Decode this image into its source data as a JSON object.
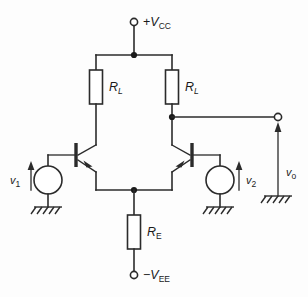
{
  "figure": {
    "background_color": "#fdfdfd",
    "line_color": "#2b2b2b"
  },
  "terminals": {
    "supply_positive": {
      "sign": "+",
      "symbol": "V",
      "subscript": "CC",
      "text": "+VCC"
    },
    "supply_negative": {
      "sign": "−",
      "symbol": "V",
      "subscript": "EE",
      "text": "−VEE"
    },
    "output": {
      "symbol": "v",
      "subscript": "o",
      "text": "vo"
    }
  },
  "components": {
    "load_resistor_left": {
      "symbol": "R",
      "subscript": "L",
      "text": "RL"
    },
    "load_resistor_right": {
      "symbol": "R",
      "subscript": "L",
      "text": "RL"
    },
    "emitter_resistor": {
      "symbol": "R",
      "subscript": "E",
      "text": "RE"
    },
    "transistor_left": {
      "type": "npn",
      "text": "Q1"
    },
    "transistor_right": {
      "type": "npn",
      "text": "Q2"
    }
  },
  "sources": {
    "input_left": {
      "symbol": "v",
      "subscript": "1",
      "text": "v1"
    },
    "input_right": {
      "symbol": "v",
      "subscript": "2",
      "text": "v2"
    }
  },
  "grounds": {
    "left": "ground",
    "right": "ground",
    "output": "ground"
  }
}
